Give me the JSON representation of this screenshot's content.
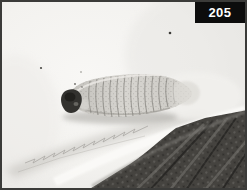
{
  "figure": {
    "number_label": "205"
  },
  "photo": {
    "type": "grayscale photograph",
    "subject": "Elongated segmented scale-insect larva resting on a pale leaf surface; serrated pale leaf edge runs diagonally with a dark net-textured leaf in the lower-right corner",
    "colors": {
      "frame": "#3b3b39",
      "label_background": "#0c0c0c",
      "label_text": "#ffffff",
      "background_light": "#f3f2ef",
      "background_shade": "#e6e5e2",
      "larva_body": "#d0cec9",
      "larva_segment_line": "#7d7b76",
      "larva_head": "#33322f",
      "leaf_shadow": "#bdbbb6",
      "leaf_edge_highlight": "#fbfaf8",
      "dark_leaf": "#45433f",
      "dark_leaf_ridge": "#75736e"
    }
  }
}
